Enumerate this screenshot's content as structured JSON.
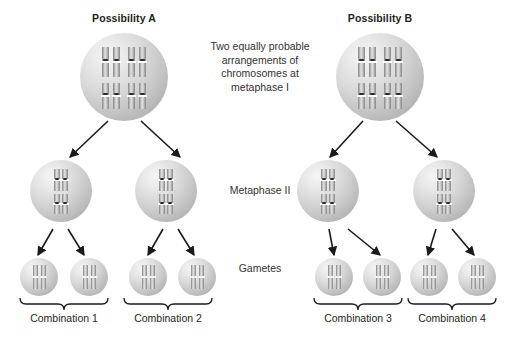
{
  "figure": {
    "background_color": "#ffffff",
    "cell_fill": "#c9c9c9",
    "chromosome_color": "#9c9c9c",
    "centromere_color": "#2b2b2b",
    "arrow_color": "#1a1a1a"
  },
  "titles": {
    "possibility_a": "Possibility A",
    "possibility_b": "Possibility B"
  },
  "center_labels": {
    "metaphase_one": "Two equally probable arrangements of chromosomes at metaphase I",
    "metaphase_one_lines": [
      "Two equally probable",
      "arrangements of",
      "chromosomes at",
      "metaphase I"
    ],
    "metaphase_two": "Metaphase II",
    "gametes": "Gametes"
  },
  "combinations": [
    {
      "label": "Combination 1"
    },
    {
      "label": "Combination 2"
    },
    {
      "label": "Combination 3"
    },
    {
      "label": "Combination 4"
    }
  ],
  "icons": {
    "arrow": "arrow-down-icon",
    "brace": "curly-brace-icon",
    "chromosome": "chromosome-icon",
    "cell": "cell-icon"
  },
  "structure": {
    "parent_cells": 2,
    "metaphase_two_cells_per_parent": 2,
    "gametes_per_metaphase_two_cell": 2,
    "chromosome_pairs_in_parent": 4,
    "chromosomes_in_metaphase_two": 2,
    "chromosomes_in_gamete": 2
  }
}
